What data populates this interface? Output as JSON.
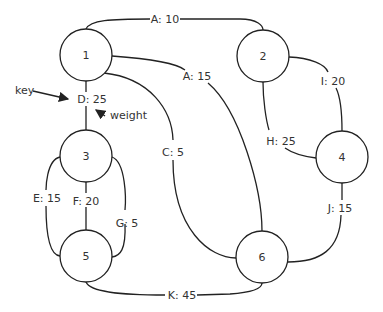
{
  "nodes": [
    {
      "id": "1",
      "x": 86,
      "y": 55
    },
    {
      "id": "2",
      "x": 263,
      "y": 56
    },
    {
      "id": "3",
      "x": 86,
      "y": 156
    },
    {
      "id": "4",
      "x": 342,
      "y": 157
    },
    {
      "id": "5",
      "x": 86,
      "y": 256
    },
    {
      "id": "6",
      "x": 262,
      "y": 257
    }
  ],
  "edges": [
    {
      "label": "A: 10",
      "from": "1",
      "to": "2"
    },
    {
      "label": "A: 15",
      "from": "1",
      "to": "6"
    },
    {
      "label": "D: 25",
      "from": "1",
      "to": "3"
    },
    {
      "label": "C: 5",
      "from": "1",
      "to": "6"
    },
    {
      "label": "I: 20",
      "from": "2",
      "to": "4"
    },
    {
      "label": "H: 25",
      "from": "2",
      "to": "4"
    },
    {
      "label": "E: 15",
      "from": "3",
      "to": "5"
    },
    {
      "label": "F: 20",
      "from": "3",
      "to": "5"
    },
    {
      "label": "G: 5",
      "from": "3",
      "to": "5"
    },
    {
      "label": "J: 15",
      "from": "4",
      "to": "6"
    },
    {
      "label": "K: 45",
      "from": "5",
      "to": "6"
    }
  ],
  "annotations": {
    "key": "key",
    "weight": "weight"
  }
}
